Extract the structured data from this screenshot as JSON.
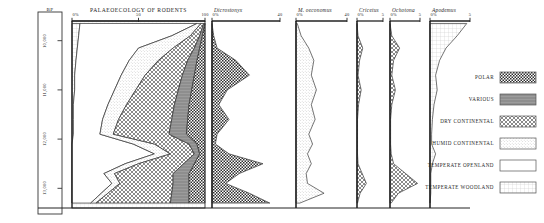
{
  "figure": {
    "main_title": "PALAEOECOLOGY OF RODENTS",
    "depth_axis_header": "BP"
  },
  "chart_data": {
    "type": "area",
    "title": "PALAEOECOLOGY OF RODENTS",
    "xlabel": "%",
    "ylabel": "BP",
    "ylim": [
      9600,
      13400
    ],
    "grid": true,
    "legend_position": "right",
    "depth_ticks": [
      "10,000",
      "11,000",
      "12,000",
      "13,000"
    ],
    "depth_tick_values": [
      10000,
      11000,
      12000,
      13000
    ],
    "main_panel": {
      "name": "PALAEOECOLOGY OF RODENTS",
      "xlim": [
        0,
        100
      ],
      "xticks": [
        "0%",
        "50",
        "100"
      ],
      "xtick_values": [
        0,
        50,
        100
      ],
      "stack_order": [
        "TEMPERATE WOODLAND",
        "TEMPERATE OPENLAND",
        "HUMID CONTINENTAL",
        "DRY CONTINENTAL",
        "VARIOUS",
        "POLAR"
      ],
      "y": [
        9650,
        9900,
        10150,
        10400,
        10700,
        11000,
        11300,
        11600,
        11900,
        12100,
        12300,
        12500,
        12700,
        12900,
        13100,
        13300
      ],
      "series": [
        {
          "name": "TEMPERATE WOODLAND",
          "values": [
            6,
            5,
            4,
            3,
            2,
            2,
            1,
            1,
            1,
            0,
            0,
            0,
            0,
            0,
            0,
            0
          ]
        },
        {
          "name": "TEMPERATE OPENLAND",
          "values": [
            88,
            70,
            46,
            40,
            35,
            30,
            26,
            22,
            20,
            46,
            62,
            40,
            24,
            30,
            22,
            14
          ]
        },
        {
          "name": "HUMID CONTINENTAL",
          "values": [
            3,
            14,
            26,
            22,
            18,
            16,
            14,
            12,
            10,
            16,
            12,
            10,
            8,
            6,
            5,
            4
          ]
        },
        {
          "name": "DRY CONTINENTAL",
          "values": [
            2,
            7,
            16,
            22,
            28,
            32,
            36,
            40,
            42,
            26,
            18,
            34,
            44,
            40,
            48,
            56
          ]
        },
        {
          "name": "VARIOUS",
          "values": [
            1,
            2,
            4,
            7,
            9,
            10,
            11,
            12,
            13,
            6,
            4,
            8,
            12,
            12,
            13,
            14
          ]
        },
        {
          "name": "POLAR",
          "values": [
            0,
            2,
            4,
            6,
            8,
            10,
            12,
            13,
            14,
            6,
            4,
            8,
            12,
            12,
            12,
            12
          ]
        }
      ]
    },
    "taxon_panels": [
      {
        "name": "Dicrostonyx",
        "fill": "POLAR",
        "xlim": [
          0,
          40
        ],
        "xticks": [
          "0%",
          "40"
        ],
        "xtick_values": [
          0,
          40
        ],
        "y": [
          9650,
          9900,
          10150,
          10400,
          10700,
          11000,
          11300,
          11600,
          11900,
          12100,
          12300,
          12500,
          12700,
          12900,
          13100,
          13300
        ],
        "values": [
          0,
          1,
          3,
          14,
          22,
          9,
          4,
          10,
          3,
          2,
          10,
          30,
          16,
          8,
          22,
          34
        ]
      },
      {
        "name": "M. oeconomus",
        "fill": "HUMID CONTINENTAL",
        "xlim": [
          0,
          40
        ],
        "xticks": [
          "0%",
          "40"
        ],
        "xtick_values": [
          0,
          40
        ],
        "y": [
          9650,
          9900,
          10150,
          10400,
          10700,
          11000,
          11300,
          11600,
          11900,
          12100,
          12300,
          12500,
          12700,
          12900,
          13100,
          13300
        ],
        "values": [
          1,
          4,
          10,
          14,
          12,
          16,
          12,
          15,
          10,
          13,
          9,
          12,
          8,
          9,
          22,
          3
        ]
      },
      {
        "name": "Cricetus",
        "fill": "DRY CONTINENTAL",
        "xlim": [
          0,
          5
        ],
        "xticks": [
          "0%",
          "5"
        ],
        "xtick_values": [
          0,
          5
        ],
        "y": [
          9650,
          9900,
          10150,
          10400,
          10700,
          11000,
          11300,
          11600,
          11900,
          12100,
          12300,
          12500,
          12700,
          12900,
          13100,
          13300
        ],
        "values": [
          0,
          0.2,
          1.1,
          0.5,
          0.2,
          0.8,
          0.3,
          0.1,
          0.1,
          0.1,
          0.1,
          0.2,
          1.0,
          1.8,
          0.6,
          0.1
        ]
      },
      {
        "name": "Ochotona",
        "fill": "DRY CONTINENTAL",
        "xlim": [
          0,
          5
        ],
        "xticks": [
          "0%",
          "5"
        ],
        "xtick_values": [
          0,
          5
        ],
        "y": [
          9650,
          9900,
          10150,
          10400,
          10700,
          11000,
          11300,
          11600,
          11900,
          12100,
          12300,
          12500,
          12700,
          12900,
          13100,
          13300
        ],
        "values": [
          0,
          0.3,
          1.6,
          0.6,
          0.3,
          0.9,
          0.3,
          0.1,
          0.1,
          0.1,
          0.2,
          0.6,
          2.6,
          4.6,
          1.4,
          0.2
        ]
      },
      {
        "name": "Apodemus",
        "fill": "TEMPERATE WOODLAND",
        "xlim": [
          0,
          5
        ],
        "xticks": [
          "0%",
          "5"
        ],
        "xtick_values": [
          0,
          5
        ],
        "y": [
          9650,
          9900,
          10150,
          10400,
          10700,
          11000,
          11300,
          11600,
          11900,
          12100,
          12300,
          12500,
          12700,
          12900,
          13100,
          13300
        ],
        "values": [
          4.6,
          3.4,
          2.0,
          1.2,
          0.7,
          0.9,
          0.5,
          0.3,
          0.2,
          0.2,
          0.7,
          0.3,
          0.1,
          0.1,
          0.1,
          0.0
        ]
      }
    ],
    "legend": [
      {
        "label": "POLAR",
        "pattern": "polar"
      },
      {
        "label": "VARIOUS",
        "pattern": "various"
      },
      {
        "label": "DRY CONTINENTAL",
        "pattern": "dry"
      },
      {
        "label": "HUMID CONTINENTAL",
        "pattern": "humid"
      },
      {
        "label": "TEMPERATE OPENLAND",
        "pattern": "openland"
      },
      {
        "label": "TEMPERATE WOODLAND",
        "pattern": "woodland"
      }
    ]
  }
}
